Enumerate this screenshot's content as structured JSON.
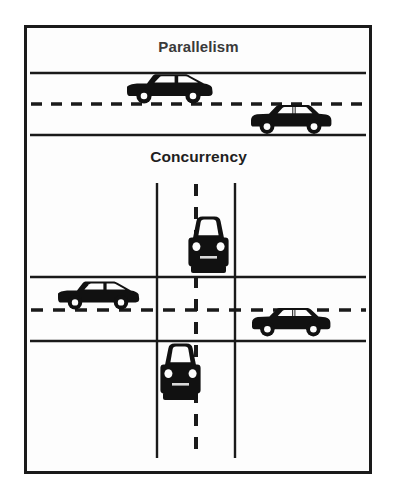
{
  "figure": {
    "title_top": "Parallelism",
    "title_bottom": "Concurrency",
    "frame": {
      "x": 24,
      "y": 25,
      "width": 348,
      "height": 449,
      "border_color": "#1a1a1a",
      "background_color": "#fdfdfd"
    },
    "palette": {
      "ink": "#111111",
      "road_line": "#1a1a1a",
      "page_background": "#ffffff",
      "caption_top_color": "#3a3a3a",
      "caption_bottom_color": "#1f1f1f"
    },
    "sections": [
      {
        "name": "parallelism",
        "label": "Parallelism",
        "description": "Two cars travelling on a straight two-lane road, one in each lane",
        "road": {
          "orientation": "horizontal",
          "edge_line_y": [
            73,
            135
          ],
          "center_dashed_line_y": 104,
          "x_start": 30,
          "x_end": 366
        },
        "vehicles": [
          {
            "id": "car-parallel-upper",
            "view": "side",
            "body_style": "hatchback",
            "direction": "left",
            "lane": "upper",
            "x": 123,
            "y": 74,
            "width": 90,
            "height": 30
          },
          {
            "id": "car-parallel-lower",
            "view": "side",
            "body_style": "sedan",
            "direction": "right",
            "lane": "lower",
            "x": 249,
            "y": 104,
            "width": 84,
            "height": 28
          }
        ]
      },
      {
        "name": "concurrency",
        "label": "Concurrency",
        "description": "Four-way intersection where a horizontal road crosses a vertical road; cars approach from several directions and must share the crossing",
        "horizontal_road": {
          "orientation": "horizontal",
          "edge_line_y": [
            277,
            341
          ],
          "center_dashed_line_y": 310,
          "x_start": 30,
          "x_end": 366
        },
        "vertical_road": {
          "orientation": "vertical",
          "edge_line_x": [
            157,
            235
          ],
          "center_dashed_line_x": 196,
          "y_start": 183,
          "y_end": 458
        },
        "vehicles": [
          {
            "id": "car-concurrency-north",
            "view": "front",
            "direction": "down",
            "x": 186,
            "y": 216,
            "width": 44,
            "height": 62
          },
          {
            "id": "car-concurrency-west",
            "view": "side",
            "body_style": "hatchback",
            "direction": "left",
            "x": 56,
            "y": 281,
            "width": 84,
            "height": 29
          },
          {
            "id": "car-concurrency-east",
            "view": "side",
            "body_style": "sedan",
            "direction": "right",
            "x": 250,
            "y": 307,
            "width": 82,
            "height": 28
          },
          {
            "id": "car-concurrency-south",
            "view": "front",
            "direction": "up",
            "x": 158,
            "y": 343,
            "width": 44,
            "height": 62
          }
        ]
      }
    ]
  }
}
